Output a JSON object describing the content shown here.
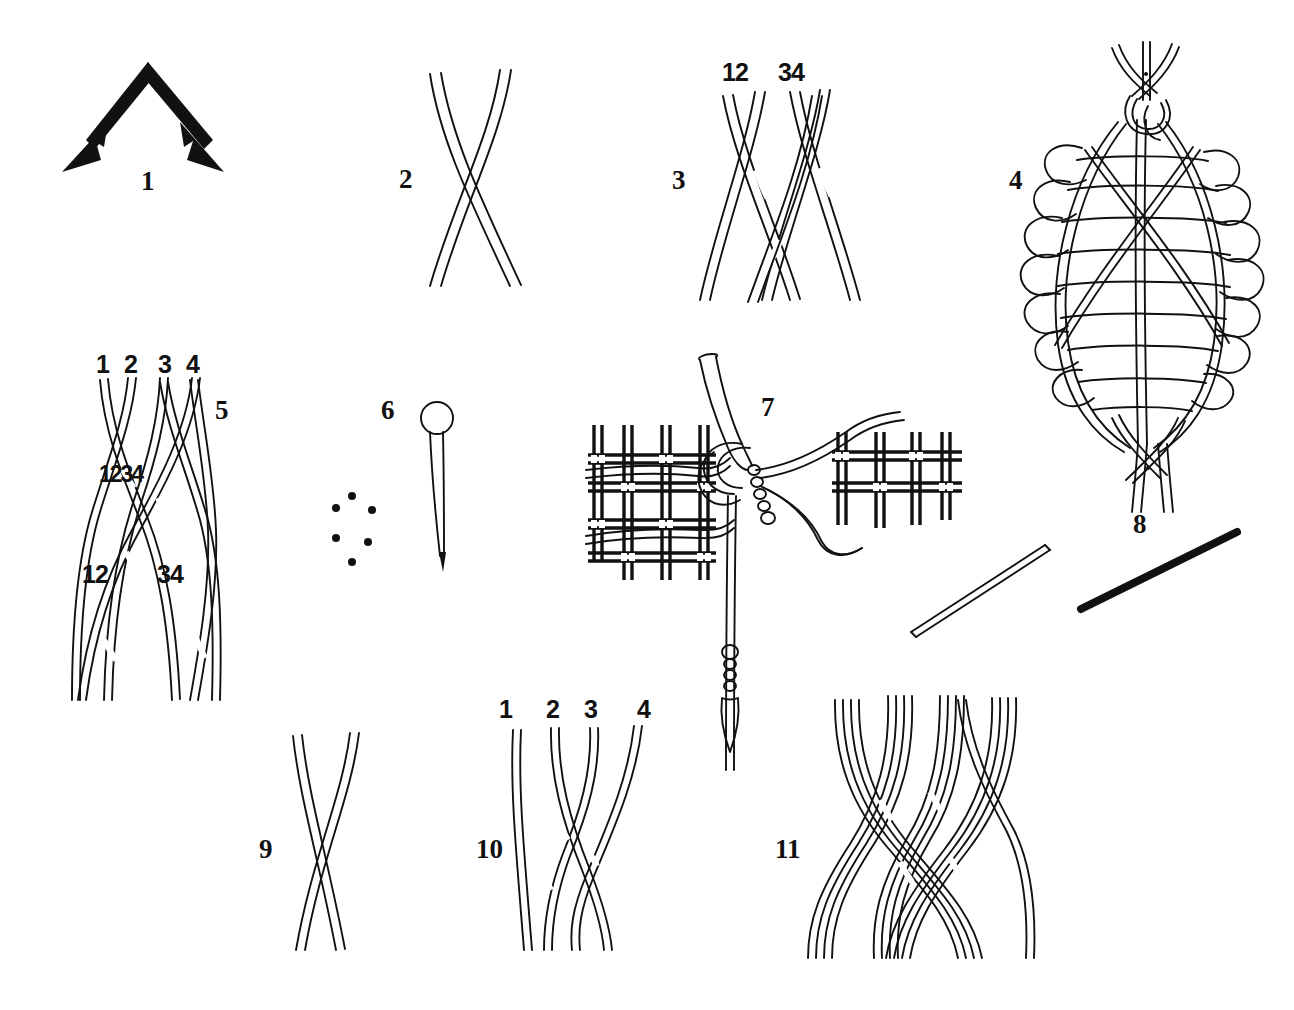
{
  "plate": {
    "title": "Braiding and weaving technique diagrams",
    "background_color": "#ffffff",
    "ink_color": "#111111",
    "width": 1294,
    "height": 1010
  },
  "figures": [
    {
      "number": "1",
      "name": "chevron-double-arrow",
      "description": "Inverted V with two arrowheads pointing down-left and down-right",
      "label_pos": [
        141,
        168
      ]
    },
    {
      "number": "2",
      "name": "two-strand-cross",
      "description": "Two flat strands crossing once",
      "label_pos": [
        399,
        166
      ]
    },
    {
      "number": "3",
      "name": "four-strand-paired-cross",
      "description": "Four strands in two pairs crossing",
      "label_pos": [
        672,
        167
      ],
      "strand_labels": [
        {
          "text": "12",
          "pos": [
            722,
            60
          ]
        },
        {
          "text": "34",
          "pos": [
            778,
            60
          ]
        }
      ]
    },
    {
      "number": "4",
      "name": "woven-oval-cage",
      "description": "Elongated oval basketry cage with horizontal rungs and spiral binding, braided top and bottom",
      "label_pos": [
        1009,
        167
      ]
    },
    {
      "number": "5",
      "name": "four-strand-braid-sequence",
      "description": "Four strands braided in stages with numbered positions at three levels",
      "label_pos": [
        215,
        397
      ],
      "strand_labels": [
        {
          "text": "1",
          "pos": [
            96,
            352
          ]
        },
        {
          "text": "2",
          "pos": [
            124,
            352
          ]
        },
        {
          "text": "3",
          "pos": [
            158,
            352
          ]
        },
        {
          "text": "4",
          "pos": [
            186,
            352
          ]
        },
        {
          "text": "1234",
          "pos": [
            99,
            463
          ]
        },
        {
          "text": "12",
          "pos": [
            82,
            562
          ]
        },
        {
          "text": "34",
          "pos": [
            157,
            562
          ]
        }
      ]
    },
    {
      "number": "6",
      "name": "ring-headed-pin-and-dots",
      "description": "Ring-headed pin beside a hexagonal arrangement of six dots",
      "label_pos": [
        381,
        397
      ]
    },
    {
      "number": "7",
      "name": "woven-fabric-with-bodkin",
      "description": "Plain-woven fabric grid with a bodkin and knotted cords passing through",
      "label_pos": [
        761,
        394
      ]
    },
    {
      "number": "8",
      "name": "rod-outline-and-solid",
      "description": "Two diagonal rods, one drawn in outline and one solid black",
      "label_pos": [
        1133,
        511
      ]
    },
    {
      "number": "9",
      "name": "two-strand-cross-lower",
      "description": "Two flat strands crossing once",
      "label_pos": [
        259,
        836
      ]
    },
    {
      "number": "10",
      "name": "four-strand-flat-braid",
      "description": "Four numbered strands in a flat braid",
      "label_pos": [
        476,
        836
      ],
      "strand_labels": [
        {
          "text": "1",
          "pos": [
            499,
            697
          ]
        },
        {
          "text": "2",
          "pos": [
            546,
            697
          ]
        },
        {
          "text": "3",
          "pos": [
            584,
            697
          ]
        },
        {
          "text": "4",
          "pos": [
            637,
            697
          ]
        }
      ]
    },
    {
      "number": "11",
      "name": "eight-strand-compound-braid",
      "description": "Compound braid of four paired bundles of strands",
      "label_pos": [
        775,
        836
      ]
    }
  ]
}
